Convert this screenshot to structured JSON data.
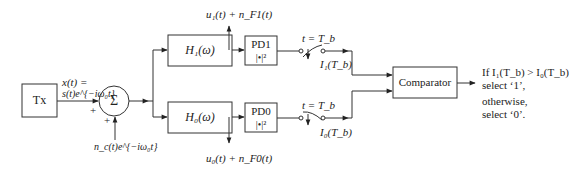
{
  "diagram": {
    "type": "block-diagram",
    "title": "",
    "blocks": {
      "tx": {
        "label": "Tx"
      },
      "sum": {
        "label": "Σ"
      },
      "h1": {
        "label": "H₁(ω)"
      },
      "h0": {
        "label": "H₀(ω)"
      },
      "pd1": {
        "label": "PD1",
        "sublabel": "|•|²"
      },
      "pd0": {
        "label": "PD0",
        "sublabel": "|•|²"
      },
      "comparator": {
        "label": "Comparator"
      }
    },
    "labels": {
      "signal_line1": "x(t) =",
      "signal_line2": "s(t)e^{−iω₀t}",
      "noise": "n_c(t)e^{−iω₀t}",
      "plus_top": "+",
      "plus_bottom": "+",
      "tap_upper": "u₁(t) + n_F1(t)",
      "tap_lower": "u₀(t) + n_F0(t)",
      "switch_upper": "t = T_b",
      "switch_lower": "t = T_b",
      "sample_upper": "I₁(T_b)",
      "sample_lower": "I₀(T_b)"
    },
    "output": {
      "line1": "If I₁(T_b) > I₀(T_b)",
      "line2": "select ‘1’,",
      "line3": "otherwise,",
      "line4": "select ‘0’."
    }
  }
}
